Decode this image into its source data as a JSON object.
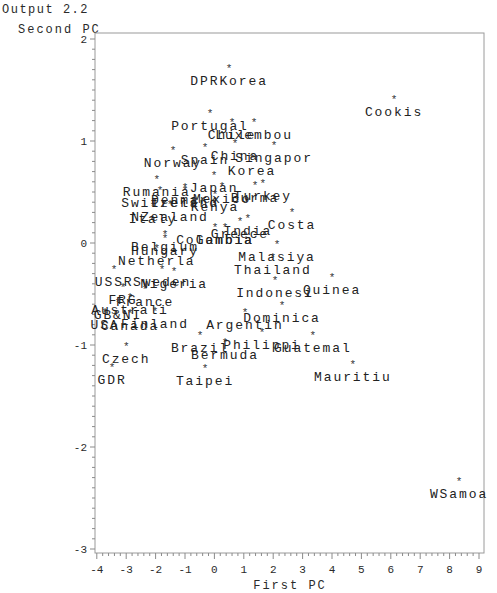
{
  "chart_data": {
    "type": "scatter",
    "title": "Output 2.2",
    "xlabel": "First PC",
    "ylabel": "Second PC",
    "xlim": [
      -4,
      9
    ],
    "ylim": [
      -3,
      2
    ],
    "xticks": [
      "-4",
      "-3",
      "-2",
      "-1",
      "0",
      "1",
      "2",
      "3",
      "4",
      "5",
      "6",
      "7",
      "8",
      "9"
    ],
    "yticks": [
      "2",
      "1",
      "0",
      "-1",
      "-2",
      "-3"
    ],
    "grid": false,
    "marker": "*",
    "points": [
      {
        "label": "DPRKorea",
        "x": 0.5,
        "y": 1.72
      },
      {
        "label": "Cookis",
        "x": 6.11,
        "y": 1.41
      },
      {
        "label": "Portugal",
        "x": -0.15,
        "y": 1.27
      },
      {
        "label": "Chile",
        "x": 0.6,
        "y": 1.19
      },
      {
        "label": "Luxembou",
        "x": 1.35,
        "y": 1.19
      },
      {
        "label": "China",
        "x": 0.7,
        "y": 0.98
      },
      {
        "label": "Singapor",
        "x": 2.03,
        "y": 0.96
      },
      {
        "label": "Spain",
        "x": -0.32,
        "y": 0.94
      },
      {
        "label": "Norway",
        "x": -1.41,
        "y": 0.91
      },
      {
        "label": "Korea",
        "x": 1.28,
        "y": 0.83
      },
      {
        "label": "Japan",
        "x": -0.01,
        "y": 0.67
      },
      {
        "label": "Rumania",
        "x": -1.96,
        "y": 0.63
      },
      {
        "label": "Turkey",
        "x": 1.65,
        "y": 0.59
      },
      {
        "label": "Burma",
        "x": 1.38,
        "y": 0.57
      },
      {
        "label": "Mexico",
        "x": 0.26,
        "y": 0.56
      },
      {
        "label": "Denmark",
        "x": -1.0,
        "y": 0.55
      },
      {
        "label": "Switzerl",
        "x": -1.85,
        "y": 0.52
      },
      {
        "label": "Ireland",
        "x": -1.0,
        "y": 0.52
      },
      {
        "label": "Kenya",
        "x": 0.02,
        "y": 0.48
      },
      {
        "label": "NZealand",
        "x": -1.51,
        "y": 0.38
      },
      {
        "label": "Italy",
        "x": -2.09,
        "y": 0.36
      },
      {
        "label": "Costa",
        "x": 2.64,
        "y": 0.3
      },
      {
        "label": "India",
        "x": 1.14,
        "y": 0.25
      },
      {
        "label": "Greece",
        "x": 0.87,
        "y": 0.22
      },
      {
        "label": "Colombia",
        "x": 0.02,
        "y": 0.16
      },
      {
        "label": "Gambia",
        "x": 0.36,
        "y": 0.16
      },
      {
        "label": "Belgium",
        "x": -1.68,
        "y": 0.09
      },
      {
        "label": "Hungary",
        "x": -1.68,
        "y": 0.05
      },
      {
        "label": "Malasiya",
        "x": 2.13,
        "y": -0.01
      },
      {
        "label": "Netherla",
        "x": -1.96,
        "y": -0.05
      },
      {
        "label": "Thailand",
        "x": 1.99,
        "y": -0.14
      },
      {
        "label": "USSR",
        "x": -3.41,
        "y": -0.25
      },
      {
        "label": "Sweden",
        "x": -1.78,
        "y": -0.25
      },
      {
        "label": "Nigeria",
        "x": -1.37,
        "y": -0.27
      },
      {
        "label": "Quinea",
        "x": 4.0,
        "y": -0.33
      },
      {
        "label": "Indonesi",
        "x": 2.06,
        "y": -0.36
      },
      {
        "label": "FRG",
        "x": -3.11,
        "y": -0.43
      },
      {
        "label": "France",
        "x": -2.36,
        "y": -0.45
      },
      {
        "label": "Australi",
        "x": -2.87,
        "y": -0.53
      },
      {
        "label": "GB&NI",
        "x": -3.28,
        "y": -0.58
      },
      {
        "label": "Dominica",
        "x": 2.3,
        "y": -0.61
      },
      {
        "label": "Finland",
        "x": -2.02,
        "y": -0.67
      },
      {
        "label": "USA",
        "x": -3.72,
        "y": -0.68
      },
      {
        "label": "Argentin",
        "x": 1.04,
        "y": -0.68
      },
      {
        "label": "Canada",
        "x": -2.87,
        "y": -0.69
      },
      {
        "label": "Philippi",
        "x": 1.62,
        "y": -0.87
      },
      {
        "label": "Brazil",
        "x": -0.49,
        "y": -0.9
      },
      {
        "label": "Guatemal",
        "x": 3.35,
        "y": -0.9
      },
      {
        "label": "Bermuda",
        "x": 0.36,
        "y": -0.97
      },
      {
        "label": "Czech",
        "x": -3.0,
        "y": -1.01
      },
      {
        "label": "Mauritiu",
        "x": 4.71,
        "y": -1.19
      },
      {
        "label": "GDR",
        "x": -3.48,
        "y": -1.22
      },
      {
        "label": "Taipei",
        "x": -0.32,
        "y": -1.23
      },
      {
        "label": "WSamoa",
        "x": 8.32,
        "y": -2.33
      }
    ]
  }
}
